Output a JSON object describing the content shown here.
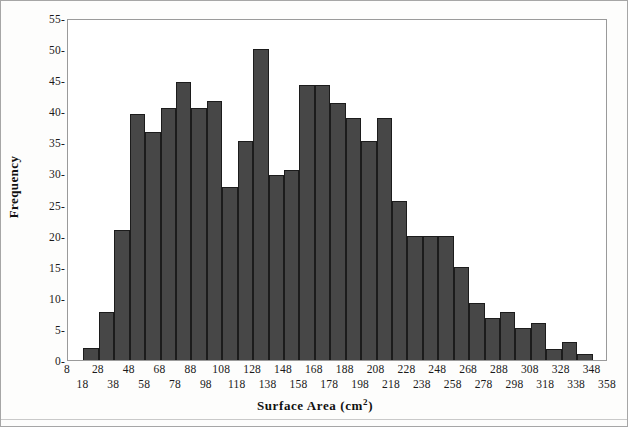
{
  "chart_data": {
    "type": "bar",
    "title": "",
    "subtitle": "",
    "xlabel": "Surface Area (cm2)",
    "xlabel_base": "Surface Area (cm",
    "xlabel_sup": "2",
    "xlabel_tail": ")",
    "ylabel": "Frequency",
    "grid": false,
    "legend": null,
    "xlim": [
      8,
      358
    ],
    "ylim": [
      0,
      55
    ],
    "bin_width": 10,
    "y_ticks": [
      0,
      5,
      10,
      15,
      20,
      25,
      30,
      35,
      40,
      45,
      50,
      55
    ],
    "y_tick_labels": [
      "0-",
      "5-",
      "10-",
      "15-",
      "20-",
      "25-",
      "30-",
      "35-",
      "40-",
      "45-",
      "50-",
      "55-"
    ],
    "x_ticks_upper": [
      8,
      28,
      48,
      68,
      88,
      108,
      128,
      148,
      168,
      188,
      208,
      228,
      248,
      268,
      288,
      308,
      328,
      348
    ],
    "x_ticks_lower": [
      18,
      38,
      58,
      78,
      98,
      118,
      138,
      158,
      178,
      198,
      218,
      238,
      258,
      278,
      298,
      318,
      338,
      358
    ],
    "bar_color": "#474747",
    "bar_edge_color": "#1c1c1c",
    "plot_border_color": "#9a9a9a",
    "figure_border_color": "#a6a6a6",
    "background_color": "#ffffff",
    "bins": [
      {
        "start": 18,
        "end": 28,
        "value": 2.0
      },
      {
        "start": 28,
        "end": 38,
        "value": 7.8
      },
      {
        "start": 38,
        "end": 48,
        "value": 20.9
      },
      {
        "start": 48,
        "end": 58,
        "value": 39.6
      },
      {
        "start": 58,
        "end": 68,
        "value": 36.6
      },
      {
        "start": 68,
        "end": 78,
        "value": 40.6
      },
      {
        "start": 78,
        "end": 88,
        "value": 44.7
      },
      {
        "start": 88,
        "end": 98,
        "value": 40.6
      },
      {
        "start": 98,
        "end": 108,
        "value": 41.6
      },
      {
        "start": 108,
        "end": 118,
        "value": 27.8
      },
      {
        "start": 118,
        "end": 128,
        "value": 35.3
      },
      {
        "start": 128,
        "end": 138,
        "value": 50.0
      },
      {
        "start": 138,
        "end": 148,
        "value": 29.7
      },
      {
        "start": 148,
        "end": 158,
        "value": 30.6
      },
      {
        "start": 158,
        "end": 168,
        "value": 44.3
      },
      {
        "start": 168,
        "end": 178,
        "value": 44.3
      },
      {
        "start": 178,
        "end": 188,
        "value": 41.3
      },
      {
        "start": 188,
        "end": 198,
        "value": 39.0
      },
      {
        "start": 198,
        "end": 208,
        "value": 35.2
      },
      {
        "start": 208,
        "end": 218,
        "value": 39.0
      },
      {
        "start": 218,
        "end": 228,
        "value": 25.5
      },
      {
        "start": 228,
        "end": 238,
        "value": 20.0
      },
      {
        "start": 238,
        "end": 248,
        "value": 20.0
      },
      {
        "start": 248,
        "end": 258,
        "value": 20.0
      },
      {
        "start": 258,
        "end": 268,
        "value": 15.0
      },
      {
        "start": 268,
        "end": 278,
        "value": 9.2
      },
      {
        "start": 278,
        "end": 288,
        "value": 6.7
      },
      {
        "start": 288,
        "end": 298,
        "value": 7.7
      },
      {
        "start": 298,
        "end": 308,
        "value": 5.2
      },
      {
        "start": 308,
        "end": 318,
        "value": 6.0
      },
      {
        "start": 318,
        "end": 328,
        "value": 1.7
      },
      {
        "start": 328,
        "end": 338,
        "value": 2.9
      },
      {
        "start": 338,
        "end": 348,
        "value": 0.9
      }
    ]
  }
}
